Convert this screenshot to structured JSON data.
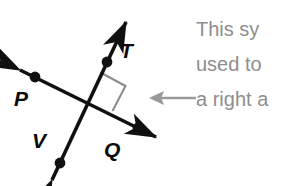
{
  "canvas": {
    "width": 294,
    "height": 186,
    "background_color": "#ffffff"
  },
  "diagram": {
    "line_color": "#101010",
    "right_angle_marker_color": "#8c8c8c",
    "label_color": "#0a0a0a",
    "points": [
      {
        "label": "P",
        "position": "upper-left",
        "on_line": "PQ"
      },
      {
        "label": "T",
        "position": "upper-right",
        "on_line": "VT"
      },
      {
        "label": "Q",
        "position": "lower-right",
        "on_line": "PQ"
      },
      {
        "label": "V",
        "position": "lower-left",
        "on_line": "VT"
      }
    ],
    "lines": [
      {
        "name": "line-PQ",
        "from": "P",
        "to": "Q",
        "arrowheads": "both"
      },
      {
        "name": "line-VT",
        "from": "V",
        "to": "T",
        "arrowheads": "both"
      }
    ],
    "right_angle_marker": {
      "name": "right-angle-square",
      "quadrant": "upper-right",
      "measure": "90"
    }
  },
  "annotation": {
    "text_color": "#8e8e8e",
    "lines": [
      "This sy",
      "used to",
      "a right a"
    ],
    "full_line_1": "This sy",
    "full_line_2": "used to",
    "full_line_3": "a right a"
  },
  "pointer": {
    "name": "left-arrow",
    "direction": "left",
    "color": "#9a9a9a"
  }
}
